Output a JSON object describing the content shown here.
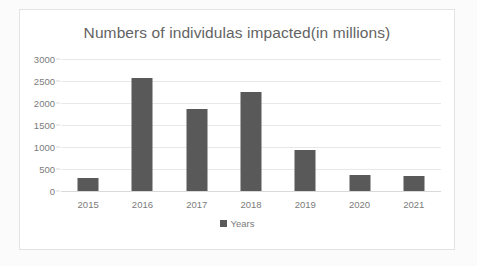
{
  "chart_data": {
    "type": "bar",
    "title": "Numbers of individulas impacted(in millions)",
    "xlabel": "",
    "ylabel": "",
    "categories": [
      "2015",
      "2016",
      "2017",
      "2018",
      "2019",
      "2020",
      "2021"
    ],
    "values": [
      300,
      2570,
      1860,
      2260,
      930,
      360,
      350
    ],
    "series": [
      {
        "name": "Years",
        "values": [
          300,
          2570,
          1860,
          2260,
          930,
          360,
          350
        ]
      }
    ],
    "ylim": [
      0,
      3000
    ],
    "yticks": [
      0,
      500,
      1000,
      1500,
      2000,
      2500,
      3000
    ],
    "ytick_labels": [
      "0",
      "500",
      "1000",
      "1500",
      "2000",
      "2500",
      "3000"
    ],
    "grid": true,
    "legend": {
      "position": "bottom",
      "entries": [
        "Years"
      ]
    },
    "colors": {
      "bar": "#595959",
      "gridline": "#e8e8e8",
      "title_text": "#636363",
      "tick_text": "#7b7b7b",
      "plot_background": "#ffffff",
      "frame_border": "#e3e3e3"
    }
  }
}
